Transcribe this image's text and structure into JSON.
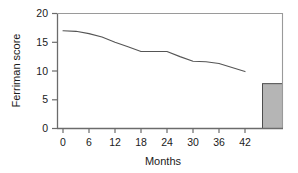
{
  "chart_data": {
    "type": "line",
    "title": "",
    "xlabel": "Months",
    "ylabel": "Ferriman score",
    "xlim": [
      -3,
      51
    ],
    "ylim": [
      0,
      20
    ],
    "xticks": [
      0,
      6,
      12,
      18,
      24,
      30,
      36,
      42
    ],
    "xtick_labels": [
      "0",
      "6",
      "12",
      "18",
      "24",
      "30",
      "36",
      "42"
    ],
    "yticks": [
      0,
      5,
      10,
      15,
      20
    ],
    "ytick_labels": [
      "0",
      "5",
      "10",
      "15",
      "20"
    ],
    "grid": false,
    "legend": "none",
    "series": [
      {
        "name": "Ferriman score over time",
        "type": "line",
        "color": "#555555",
        "x": [
          0,
          3,
          6,
          9,
          12,
          15,
          18,
          21,
          24,
          27,
          30,
          33,
          36,
          39,
          42
        ],
        "values": [
          17.0,
          16.9,
          16.5,
          15.9,
          15.0,
          14.2,
          13.4,
          13.4,
          13.4,
          12.5,
          11.7,
          11.6,
          11.3,
          10.6,
          9.9
        ]
      },
      {
        "name": "Final value bar",
        "type": "bar",
        "color": "#b5b5b5",
        "edge_color": "#4d4d4d",
        "x": [
          48
        ],
        "values": [
          7.8
        ]
      }
    ]
  },
  "axis": {
    "ylabel": "Ferriman score",
    "xlabel": "Months",
    "ytick_0": "0",
    "ytick_5": "5",
    "ytick_10": "10",
    "ytick_15": "15",
    "ytick_20": "20",
    "xtick_0": "0",
    "xtick_6": "6",
    "xtick_12": "12",
    "xtick_18": "18",
    "xtick_24": "24",
    "xtick_30": "30",
    "xtick_36": "36",
    "xtick_42": "42"
  },
  "colors": {
    "line": "#555555",
    "bar_fill": "#b5b5b5",
    "bar_edge": "#4d4d4d",
    "axis": "#6b6b6b",
    "text": "#1a1a1a",
    "background": "#ffffff"
  }
}
